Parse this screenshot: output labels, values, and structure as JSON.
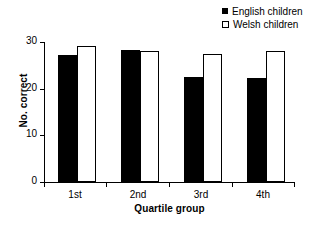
{
  "chart_data": {
    "type": "bar",
    "title": "",
    "xlabel": "Quartile group",
    "ylabel": "No. correct",
    "categories": [
      "1st",
      "2nd",
      "3rd",
      "4th"
    ],
    "series": [
      {
        "name": "English children",
        "values": [
          27.3,
          28.4,
          22.5,
          22.3
        ],
        "color": "#000000",
        "marker": "filled-square"
      },
      {
        "name": "Welsh children",
        "values": [
          29.2,
          28.1,
          27.4,
          28.1
        ],
        "color": "#ffffff",
        "marker": "open-square"
      }
    ],
    "ylim": [
      0,
      30
    ],
    "yticks": [
      0,
      10,
      20,
      30
    ],
    "ytick_labels": [
      "0",
      "10",
      "20",
      "30"
    ],
    "grid": false,
    "legend_position": "top-right"
  },
  "axes": {
    "y_label": "No. correct",
    "x_label": "Quartile group",
    "y_ticks": [
      "0",
      "10",
      "20",
      "30"
    ],
    "x_ticks": [
      "1st",
      "2nd",
      "3rd",
      "4th"
    ]
  },
  "legend": {
    "entries": [
      {
        "label": "English children",
        "style": "filled"
      },
      {
        "label": "Welsh children",
        "style": "open"
      }
    ]
  }
}
